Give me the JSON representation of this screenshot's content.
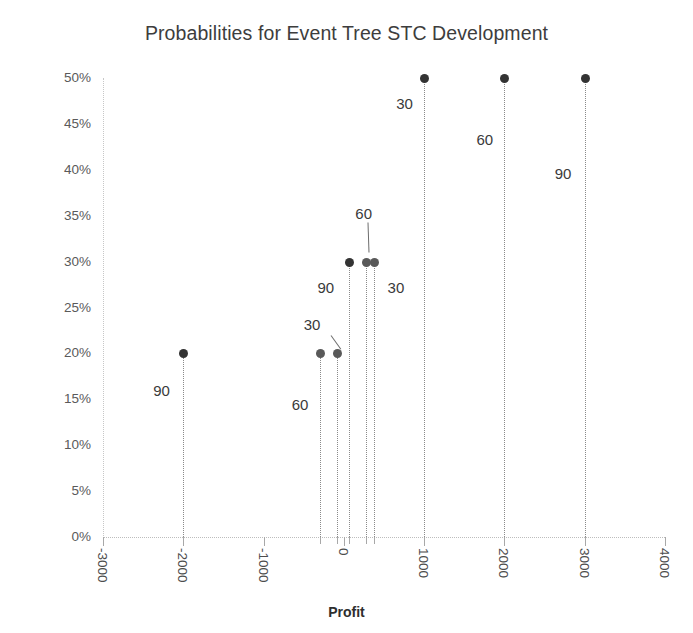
{
  "chart_data": {
    "type": "scatter",
    "title": "Probabilities for Event Tree STC Development",
    "xlabel": "Profit",
    "ylabel": "Probability",
    "xlim": [
      -3000,
      4000
    ],
    "ylim": [
      0,
      0.5
    ],
    "grid": false,
    "legend": null,
    "x_ticks": [
      "-3000",
      "-2000",
      "-1000",
      "0",
      "1000",
      "2000",
      "3000",
      "4000"
    ],
    "x_tick_values": [
      -3000,
      -2000,
      -1000,
      0,
      1000,
      2000,
      3000,
      4000
    ],
    "y_ticks": [
      "0%",
      "5%",
      "10%",
      "15%",
      "20%",
      "25%",
      "30%",
      "35%",
      "40%",
      "45%",
      "50%"
    ],
    "y_tick_values": [
      0,
      0.05,
      0.1,
      0.15,
      0.2,
      0.25,
      0.3,
      0.35,
      0.4,
      0.45,
      0.5
    ],
    "points": [
      {
        "x": -2000,
        "y": 0.2,
        "label": "90"
      },
      {
        "x": -300,
        "y": 0.2,
        "label": "60"
      },
      {
        "x": -90,
        "y": 0.2,
        "label": "30"
      },
      {
        "x": 70,
        "y": 0.3,
        "label": "90"
      },
      {
        "x": 280,
        "y": 0.3,
        "label": "60"
      },
      {
        "x": 370,
        "y": 0.3,
        "label": "30"
      },
      {
        "x": 1000,
        "y": 0.5,
        "label": "30"
      },
      {
        "x": 2000,
        "y": 0.5,
        "label": "60"
      },
      {
        "x": 3000,
        "y": 0.5,
        "label": "90"
      }
    ],
    "marker_color": "#595959",
    "stem_color": "#8a8a8a",
    "axis_color": "#bdbdbd",
    "title_color": "#3d3d3d"
  }
}
